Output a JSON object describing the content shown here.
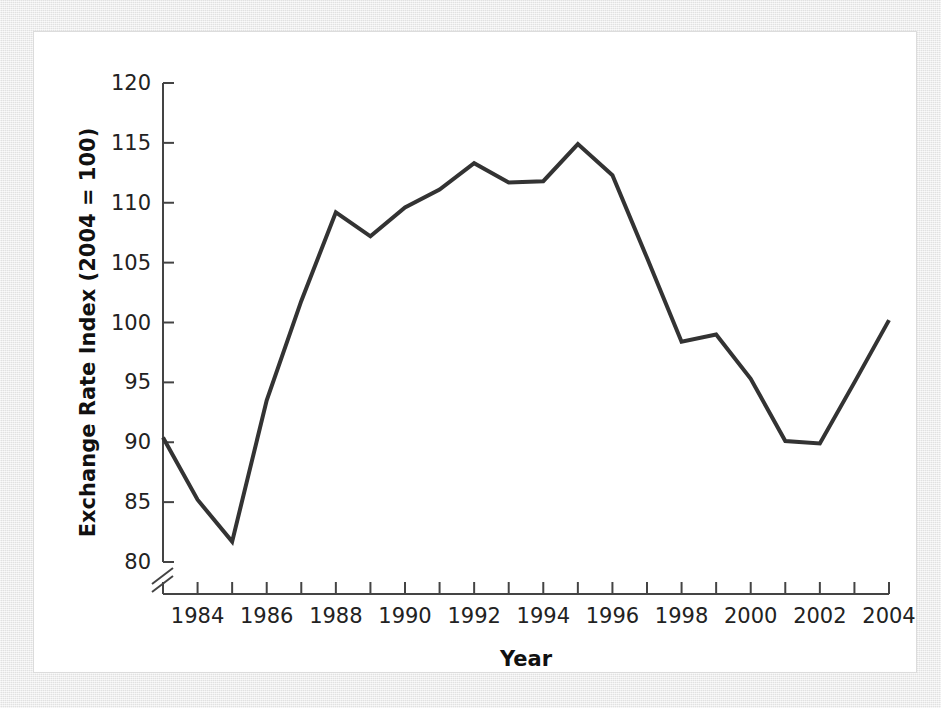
{
  "figure": {
    "background_color": "#e9e9e9",
    "panel_color": "#ffffff"
  },
  "chart_data": {
    "type": "line",
    "title": "",
    "xlabel": "Year",
    "ylabel": "Exchange Rate Index (2004 = 100)",
    "xlim": [
      1983,
      2004
    ],
    "ylim": [
      80,
      120
    ],
    "y_axis_break": true,
    "y_break_below": 80,
    "grid": false,
    "legend": null,
    "line_color": "#333333",
    "line_width": 4,
    "x_tick_values": [
      1983,
      1984,
      1985,
      1986,
      1987,
      1988,
      1989,
      1990,
      1991,
      1992,
      1993,
      1994,
      1995,
      1996,
      1997,
      1998,
      1999,
      2000,
      2001,
      2002,
      2003,
      2004
    ],
    "x_tick_labels": [
      "",
      "1984",
      "",
      "1986",
      "",
      "1988",
      "",
      "1990",
      "",
      "1992",
      "",
      "1994",
      "",
      "1996",
      "",
      "1998",
      "",
      "2000",
      "",
      "2002",
      "",
      "2004"
    ],
    "y_tick_values": [
      80,
      85,
      90,
      95,
      100,
      105,
      110,
      115,
      120
    ],
    "y_tick_labels": [
      "80",
      "85",
      "90",
      "95",
      "100",
      "105",
      "110",
      "115",
      "120"
    ],
    "x": [
      1983,
      1984,
      1985,
      1986,
      1987,
      1988,
      1989,
      1990,
      1991,
      1992,
      1993,
      1994,
      1995,
      1996,
      1997,
      1998,
      1999,
      2000,
      2001,
      2002,
      2003,
      2004
    ],
    "values": [
      90.4,
      85.2,
      81.7,
      93.5,
      101.8,
      109.2,
      107.2,
      109.6,
      111.1,
      113.3,
      111.7,
      111.8,
      114.9,
      112.3,
      105.4,
      98.4,
      99.0,
      95.3,
      90.1,
      89.9,
      95.0,
      100.2
    ],
    "series": [
      {
        "name": "Exchange Rate Index",
        "values": [
          90.4,
          85.2,
          81.7,
          93.5,
          101.8,
          109.2,
          107.2,
          109.6,
          111.1,
          113.3,
          111.7,
          111.8,
          114.9,
          112.3,
          105.4,
          98.4,
          99.0,
          95.3,
          90.1,
          89.9,
          95.0,
          100.2
        ]
      }
    ]
  }
}
